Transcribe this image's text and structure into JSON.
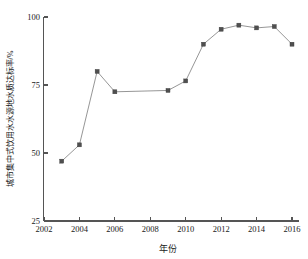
{
  "chart_data": {
    "type": "line",
    "title": "",
    "xlabel": "年份",
    "ylabel": "城市集中式饮用水水源地水质达标率/%",
    "xlim": [
      2002,
      2016
    ],
    "ylim": [
      25,
      100
    ],
    "grid": false,
    "legend": null,
    "x_ticks": [
      "2002",
      "2004",
      "2006",
      "2008",
      "2010",
      "2012",
      "2014",
      "2016"
    ],
    "x_tick_values": [
      2002,
      2004,
      2006,
      2008,
      2010,
      2012,
      2014,
      2016
    ],
    "y_ticks": [
      "25",
      "50",
      "75",
      "100"
    ],
    "y_tick_values": [
      25,
      50,
      75,
      100
    ],
    "marker": "square",
    "marker_color": "#4f4f4f",
    "line_color": "#8a8a8a",
    "x": [
      2003,
      2004,
      2005,
      2006,
      2009,
      2010,
      2011,
      2012,
      2013,
      2014,
      2015,
      2016
    ],
    "values": [
      47,
      53,
      80,
      72.5,
      73,
      76.5,
      90,
      95.5,
      97,
      96,
      96.5,
      90
    ],
    "series": [
      {
        "name": "城市集中式饮用水水源地水质达标率",
        "x": [
          2003,
          2004,
          2005,
          2006,
          2009,
          2010,
          2011,
          2012,
          2013,
          2014,
          2015,
          2016
        ],
        "values": [
          47,
          53,
          80,
          72.5,
          73,
          76.5,
          90,
          95.5,
          97,
          96,
          96.5,
          90
        ]
      }
    ]
  }
}
